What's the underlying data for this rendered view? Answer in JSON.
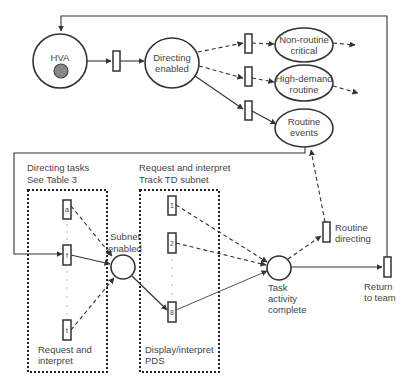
{
  "diagram": {
    "type": "petri-net",
    "colors": {
      "line": "#333333",
      "text": "#444444",
      "token": "#888888",
      "background": "#ffffff"
    },
    "places": {
      "hva": {
        "label": "HVA",
        "has_token": true
      },
      "directing_enabled": {
        "line1": "Directing",
        "line2": "enabled"
      },
      "non_routine_critical": {
        "line1": "Non-routine",
        "line2": "critical"
      },
      "high_demand_routine": {
        "line1": "High-demand",
        "line2": "routine"
      },
      "routine_events": {
        "line1": "Routine",
        "line2": "events"
      },
      "subnet_enabled": {
        "line1": "Subnet",
        "line2": "enabled"
      },
      "task_activity_complete": {
        "line1": "Task",
        "line2": "activity",
        "line3": "complete"
      }
    },
    "transitions": {
      "routine_directing": {
        "line1": "Routine",
        "line2": "directing"
      },
      "return_to_team": {
        "line1": "Return",
        "line2": "to team"
      }
    },
    "subnets": {
      "directing_tasks": {
        "title1": "Directing tasks",
        "title2": "See Table 3",
        "items": [
          "a",
          "f",
          "t"
        ],
        "footer1": "Request and",
        "footer2": "interpret"
      },
      "track_td": {
        "title1": "Request and interpret",
        "title2": "Track TD subnet",
        "items": [
          "1",
          "2",
          "8"
        ],
        "footer1": "Display/interpret",
        "footer2": "PDS"
      }
    }
  }
}
